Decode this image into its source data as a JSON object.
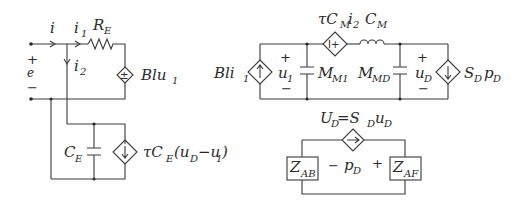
{
  "diagram": {
    "left_circuit": {
      "current_i": "i",
      "current_i1": "i",
      "current_i1_sub": "1",
      "current_i2": "i",
      "current_i2_sub": "2",
      "resistor": "R",
      "resistor_sub": "E",
      "voltage_plus": "+",
      "voltage_label": "e",
      "voltage_minus": "−",
      "dep_source_label": "Blu",
      "dep_source_sub": "1",
      "dep_source_sign": "±"
    },
    "lower_left_circuit": {
      "capacitor": "C",
      "capacitor_sub": "E",
      "dep_source_label_a": "τC",
      "dep_source_label_a_sub": "E",
      "dep_source_label_b": "(u",
      "dep_source_label_b_sub": "D",
      "dep_source_label_c": "−u",
      "dep_source_label_c_sub": "1",
      "dep_source_label_d": ")"
    },
    "middle_circuit": {
      "left_source_label": "Bli",
      "left_source_sub": "1",
      "u1_plus": "+",
      "u1_label": "u",
      "u1_sub": "1",
      "u1_minus": "−",
      "cap1": "M",
      "cap1_sub": "M1",
      "series_source_label": "τC",
      "series_source_sub": "M",
      "series_source_label2": "i",
      "series_source_sub2": "2",
      "series_source_sign": "I+",
      "inductor": "C",
      "inductor_sub": "M",
      "cap2": "M",
      "cap2_sub": "MD",
      "uD_plus": "+",
      "uD_label": "u",
      "uD_sub": "D",
      "uD_minus": "−",
      "right_source_label": "S",
      "right_source_sub": "D",
      "right_source_label2": "p",
      "right_source_sub2": "D"
    },
    "lower_right_circuit": {
      "source_label_U": "U",
      "source_label_U_sub": "D",
      "source_label_eq": "=S",
      "source_label_S_sub": "D",
      "source_label_u": "u",
      "source_label_u_sub": "D",
      "minus": "−",
      "p_label": "p",
      "p_sub": "D",
      "plus": "+",
      "z_left": "Z",
      "z_left_sub": "AB",
      "z_right": "Z",
      "z_right_sub": "AF"
    }
  }
}
